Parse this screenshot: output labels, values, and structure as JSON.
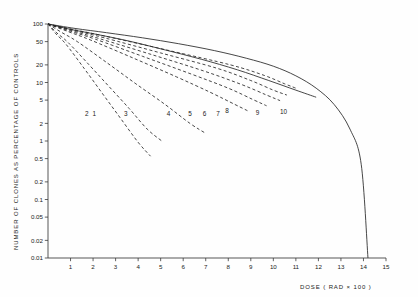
{
  "chart_data": {
    "type": "line",
    "title": "",
    "xlabel": "DOSE   ( RAD × 100 )",
    "ylabel": "NUMBER OF CLONES AS PERCENTAGE OF CONTROLS",
    "yscale": "log",
    "xscale": "linear",
    "xlim": [
      0,
      15
    ],
    "ylim": [
      0.01,
      100
    ],
    "grid": false,
    "legend": "inline-curve-labels",
    "xticks": [
      "1",
      "2",
      "3",
      "4",
      "5",
      "6",
      "7",
      "8",
      "9",
      "10",
      "11",
      "12",
      "13",
      "14",
      "15"
    ],
    "xtick_values": [
      1,
      2,
      3,
      4,
      5,
      6,
      7,
      8,
      9,
      10,
      11,
      12,
      13,
      14,
      15
    ],
    "yticks": [
      "100",
      "50",
      "20",
      "10",
      "5",
      "2",
      "1",
      "0.5",
      "0.2",
      "0.1",
      "0.05",
      "0.02",
      "0.01"
    ],
    "ytick_values": [
      100,
      50,
      20,
      10,
      5,
      2,
      1,
      0.5,
      0.2,
      0.1,
      0.05,
      0.02,
      0.01
    ],
    "series": [
      {
        "name": "1",
        "label": "1",
        "style": "dashed",
        "label_x": 2.05,
        "label_y": 2.95,
        "x": [
          0,
          0.35,
          0.8,
          1.6,
          2.4,
          3.2,
          4.0,
          4.55
        ],
        "y": [
          100,
          68,
          45,
          17.5,
          6.6,
          2.5,
          0.95,
          0.55
        ]
      },
      {
        "name": "2",
        "label": "2",
        "style": "dashed",
        "label_x": 1.72,
        "label_y": 2.95,
        "x": [
          0,
          0.4,
          0.9,
          1.8,
          2.7,
          3.6,
          4.4,
          5.05
        ],
        "y": [
          100,
          70,
          48,
          20.5,
          8.6,
          3.6,
          1.6,
          1.0
        ]
      },
      {
        "name": "3",
        "label": "3",
        "style": "dashed",
        "label_x": 3.45,
        "label_y": 2.95,
        "x": [
          0,
          0.6,
          1.3,
          2.6,
          3.9,
          5.2,
          6.3,
          7.0
        ],
        "y": [
          100,
          72,
          50,
          22,
          9.5,
          4.2,
          2.0,
          1.35
        ]
      },
      {
        "name": "4",
        "label": "4",
        "style": "dashed",
        "label_x": 5.35,
        "label_y": 2.95,
        "x": [
          0,
          0.9,
          1.9,
          3.8,
          5.7,
          7.2,
          8.3,
          8.85
        ],
        "y": [
          100,
          74,
          53,
          26,
          12.5,
          6.8,
          4.2,
          3.3
        ]
      },
      {
        "name": "5",
        "label": "5",
        "style": "dashed",
        "label_x": 6.3,
        "label_y": 2.95,
        "x": [
          0,
          1.0,
          2.1,
          4.2,
          6.3,
          8.0,
          9.1,
          9.7
        ],
        "y": [
          100,
          75,
          55,
          28,
          14.2,
          8.0,
          5.1,
          4.0
        ]
      },
      {
        "name": "6",
        "label": "6",
        "style": "dashed",
        "label_x": 6.95,
        "label_y": 2.95,
        "x": [
          0,
          1.1,
          2.3,
          4.6,
          6.9,
          8.6,
          9.7,
          10.3
        ],
        "y": [
          100,
          76,
          56,
          30,
          15.8,
          9.2,
          6.1,
          4.9
        ]
      },
      {
        "name": "7",
        "label": "7",
        "style": "dashed",
        "label_x": 7.55,
        "label_y": 2.95,
        "x": [
          0,
          1.2,
          2.5,
          5.0,
          7.5,
          9.0,
          10.0,
          10.6
        ],
        "y": [
          100,
          77,
          58,
          32,
          17.5,
          10.8,
          7.4,
          6.1
        ]
      },
      {
        "name": "8",
        "label": "8",
        "style": "dashed",
        "label_x": 7.95,
        "label_y": 3.3,
        "x": [
          0,
          1.3,
          2.7,
          5.4,
          8.1,
          9.6,
          10.5,
          11.0
        ],
        "y": [
          100,
          78,
          60,
          35,
          20,
          13.2,
          9.5,
          8.0
        ]
      },
      {
        "name": "9",
        "label": "9",
        "style": "solid",
        "label_x": 9.3,
        "label_y": 3.05,
        "x": [
          0,
          1.0,
          2.2,
          3.6,
          5.2,
          6.8,
          8.4,
          9.8,
          11.0,
          11.9
        ],
        "y": [
          100,
          81,
          66,
          51,
          36,
          25,
          16.5,
          10.8,
          7.4,
          5.6
        ]
      },
      {
        "name": "10",
        "label": "10",
        "style": "solid",
        "label_x": 10.45,
        "label_y": 3.15,
        "x": [
          0,
          1.2,
          2.6,
          4.2,
          5.8,
          7.4,
          8.8,
          10.0,
          11.0,
          11.9,
          12.7,
          13.4,
          13.9,
          14.2
        ],
        "y": [
          100,
          84,
          71,
          58,
          46,
          35,
          26,
          19,
          13,
          8.0,
          4.2,
          1.6,
          0.4,
          0.01
        ]
      }
    ]
  },
  "axes": {
    "y_axis_title": "NUMBER OF CLONES AS PERCENTAGE OF CONTROLS",
    "x_axis_title": "DOSE   ( RAD × 100 )"
  },
  "colors": {
    "background": "#fefefe",
    "axis": "#3a3a3a",
    "curve": "#262626",
    "text": "#1a1a1a"
  }
}
